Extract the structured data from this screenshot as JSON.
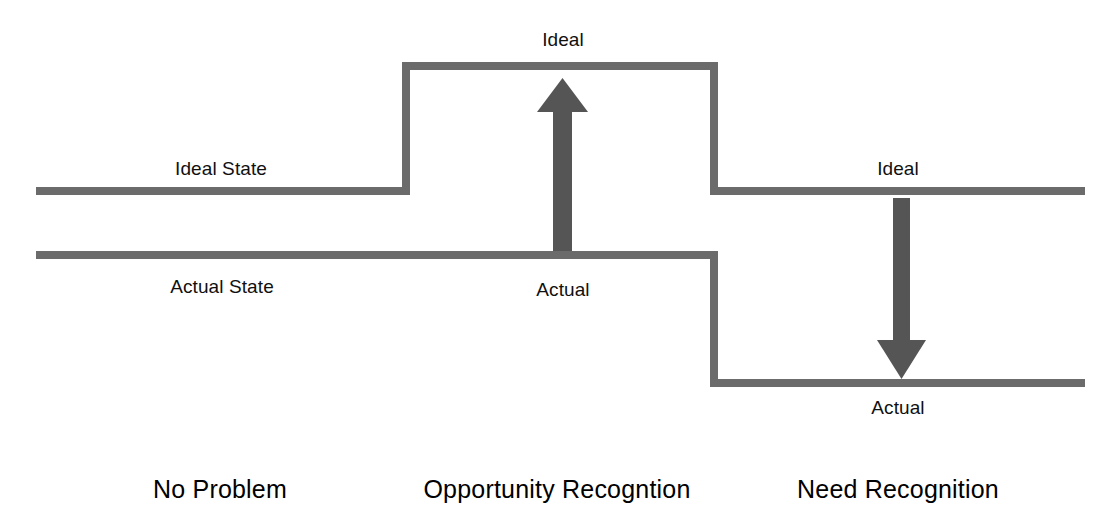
{
  "figure": {
    "type": "process-gap-diagram",
    "background_color": "#ffffff",
    "line_color": "#6b6b6b",
    "arrow_color": "#555555",
    "text_color": "#101010",
    "caption_color": "#000000"
  },
  "sections": [
    {
      "id": "no-problem",
      "caption": "No Problem",
      "caption_x": 220,
      "caption_y": 477,
      "state": "ideal and actual lines parallel, no gap arrow"
    },
    {
      "id": "opportunity-recognition",
      "caption": "Opportunity Recogntion",
      "caption_x": 557,
      "caption_y": 477,
      "state": "ideal state raised above actual, upward gap arrow"
    },
    {
      "id": "need-recognition",
      "caption": "Need Recognition",
      "caption_x": 898,
      "caption_y": 477,
      "state": "actual state dropped below ideal, downward gap arrow"
    }
  ],
  "labels": [
    {
      "id": "ideal-state-left",
      "text": "Ideal State",
      "x": 221,
      "y": 159
    },
    {
      "id": "actual-state-left",
      "text": "Actual State",
      "x": 222,
      "y": 277
    },
    {
      "id": "ideal-middle",
      "text": "Ideal",
      "x": 563,
      "y": 30
    },
    {
      "id": "actual-middle",
      "text": "Actual",
      "x": 563,
      "y": 280
    },
    {
      "id": "ideal-right",
      "text": "Ideal",
      "x": 898,
      "y": 159
    },
    {
      "id": "actual-right",
      "text": "Actual",
      "x": 898,
      "y": 398
    }
  ],
  "geometry": {
    "stroke_width": 8,
    "ideal_path": "M 36 191 L 406 191 L 406 66 L 714 66 L 714 191 L 1085 191",
    "actual_path": "M 36 255 L 714 255 L 714 383 L 1085 383",
    "arrow_up": {
      "shaft_x": 562,
      "shaft_top": 110,
      "shaft_bottom": 251,
      "shaft_width": 19,
      "head_left": 537,
      "head_right": 588,
      "head_bottom": 112,
      "tip_y": 78
    },
    "arrow_down": {
      "shaft_x": 901,
      "shaft_top": 198,
      "shaft_bottom": 342,
      "shaft_width": 17,
      "head_left": 877,
      "head_right": 926,
      "head_top": 340,
      "tip_y": 379
    }
  }
}
